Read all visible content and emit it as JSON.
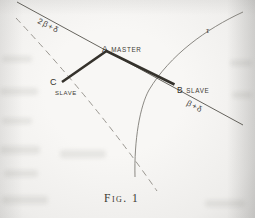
{
  "figure": {
    "caption": "Fig. 1",
    "stations": {
      "a": {
        "letter": "A",
        "role": "MASTER"
      },
      "b": {
        "letter": "B",
        "role": "SLAVE"
      },
      "c": {
        "letter": "C",
        "role": "SLAVE"
      }
    },
    "line_labels": {
      "upper_baseline": "2β+δ",
      "lower_baseline": "β+δ",
      "curve": "τ"
    },
    "colors": {
      "paper": "#f2f1ef",
      "ink_heavy": "#35322c",
      "ink_thin": "#55524c",
      "ink_dashed": "#8e8b85",
      "ink_curve": "#6f6c66",
      "ink_text": "#3f3c36"
    }
  }
}
